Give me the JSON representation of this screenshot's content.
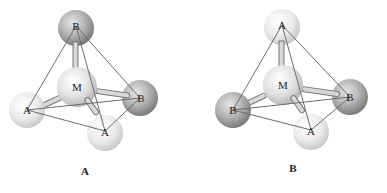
{
  "figure": {
    "structures": [
      {
        "caption": "A",
        "center_label": "M",
        "atoms": {
          "top": "B",
          "left": "A",
          "right": "B",
          "bottom": "A"
        }
      },
      {
        "caption": "B",
        "center_label": "M",
        "atoms": {
          "top": "A",
          "left": "B",
          "right": "B",
          "bottom": "A"
        }
      }
    ]
  },
  "colors": {
    "light_atom": "#e8e8e8",
    "dark_atom": "#9a9a9a",
    "center_atom": "#dcdcdc",
    "edge": "#6b6b6b",
    "bond": "#bbbbbb"
  }
}
